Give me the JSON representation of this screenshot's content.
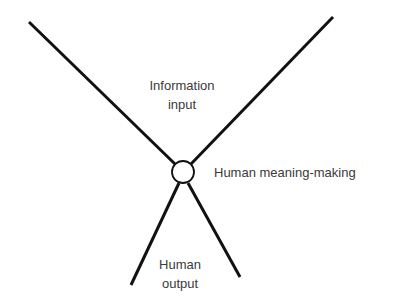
{
  "diagram": {
    "labels": {
      "input_line1": "Information",
      "input_line2": "input",
      "meaning": "Human meaning-making",
      "output_line1": "Human",
      "output_line2": "output"
    },
    "colors": {
      "line": "#111111",
      "text": "#3a3a3a",
      "background": "#ffffff"
    }
  }
}
